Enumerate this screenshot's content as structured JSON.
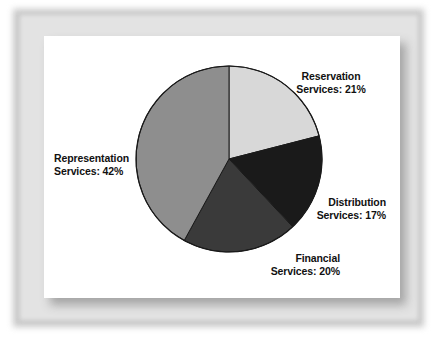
{
  "chart_data": {
    "type": "pie",
    "title": "",
    "subtitle": "",
    "xlabel": "",
    "ylabel": "",
    "legend_position": "labels-outside",
    "grid": false,
    "start_angle_deg": 0,
    "direction": "clockwise",
    "categories": [
      "Reservation Services",
      "Distribution Services",
      "Financial Services",
      "Representation Services"
    ],
    "values": [
      21,
      17,
      20,
      42
    ],
    "value_unit": "%",
    "colors": [
      "#d8d8d8",
      "#1a1a1a",
      "#3a3a3a",
      "#8e8e8e"
    ],
    "slices": [
      {
        "name": "Reservation Services",
        "value": 21,
        "label_line1": "Reservation",
        "label_line2": "Services:  21%",
        "color": "#d8d8d8",
        "start_deg": 0,
        "end_deg": 75.6
      },
      {
        "name": "Distribution Services",
        "value": 17,
        "label_line1": "Distribution",
        "label_line2": "Services:  17%",
        "color": "#1a1a1a",
        "start_deg": 75.6,
        "end_deg": 136.8
      },
      {
        "name": "Financial Services",
        "value": 20,
        "label_line1": "Financial",
        "label_line2": "Services:  20%",
        "color": "#3a3a3a",
        "start_deg": 136.8,
        "end_deg": 208.8
      },
      {
        "name": "Representation Services",
        "value": 42,
        "label_line1": "Representation",
        "label_line2": "Services:  42%",
        "color": "#8e8e8e",
        "start_deg": 208.8,
        "end_deg": 360
      }
    ]
  },
  "labels": {
    "reservation": {
      "line1": "Reservation",
      "line2": "Services:  21%"
    },
    "distribution": {
      "line1": "Distribution",
      "line2": "Services:  17%"
    },
    "financial": {
      "line1": "Financial",
      "line2": "Services:  20%"
    },
    "representation": {
      "line1": "Representation",
      "line2": "Services:  42%"
    }
  }
}
